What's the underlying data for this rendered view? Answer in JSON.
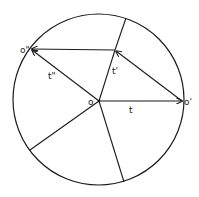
{
  "diagram": {
    "stroke_color": "#1a1a1a",
    "background": "#ffffff",
    "circle": {
      "cx": 98.5,
      "cy": 99.5,
      "r": 85.5
    },
    "points": {
      "O": {
        "label": "o",
        "x": 99,
        "y": 101
      },
      "O1": {
        "label": "o'",
        "x": 183,
        "y": 101
      },
      "O2": {
        "label": "o\"",
        "x": 31,
        "y": 49
      },
      "P": {
        "x": 115,
        "y": 50
      }
    },
    "vectors": [
      {
        "name": "t",
        "label": "t",
        "from": "O",
        "to": "O1"
      },
      {
        "name": "t-prime",
        "label": "t'",
        "from": "O",
        "to": "P"
      },
      {
        "name": "t-double-prime",
        "label": "t\"",
        "from": "O",
        "to": "O2"
      }
    ],
    "labels": {
      "o": "o",
      "o_prime": "o'",
      "o_double_prime": "o\"",
      "t": "t",
      "t_prime": "t'",
      "t_double_prime": "t\""
    }
  }
}
